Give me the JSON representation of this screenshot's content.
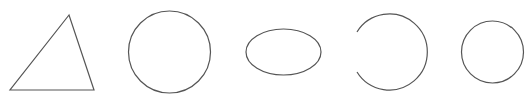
{
  "canvas": {
    "width": 532,
    "height": 97,
    "background": "#ffffff",
    "stroke_color": "#555555"
  },
  "shapes": [
    {
      "type": "triangle",
      "points": "69,15 10,90 94,90"
    },
    {
      "type": "circle",
      "cx": 169.5,
      "cy": 52,
      "r": 41
    },
    {
      "type": "ellipse",
      "cx": 283.5,
      "cy": 52,
      "rx": 37.5,
      "ry": 23
    },
    {
      "type": "open-arc",
      "d": "M 357 32 A 38 38 0 1 1 357 72"
    },
    {
      "type": "circle",
      "cx": 492.5,
      "cy": 52,
      "r": 31
    }
  ]
}
